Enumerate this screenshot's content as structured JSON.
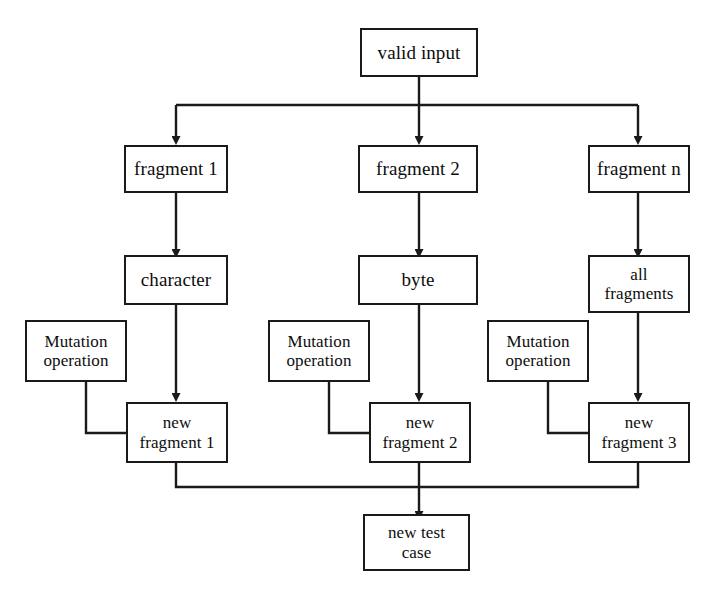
{
  "diagram": {
    "style": {
      "background": "#ffffff",
      "stroke": "#1a1a1a",
      "text": "#0d0d0d"
    },
    "nodes": {
      "valid_input": {
        "label": "valid input"
      },
      "fragment_1": {
        "label": "fragment 1"
      },
      "fragment_2": {
        "label": "fragment 2"
      },
      "fragment_n": {
        "label": "fragment n"
      },
      "character": {
        "label": "character"
      },
      "byte": {
        "label": "byte"
      },
      "all_fragments": {
        "label_line1": "all",
        "label_line2": "fragments"
      },
      "mutation_operation_1": {
        "label_line1": "Mutation",
        "label_line2": "operation"
      },
      "mutation_operation_2": {
        "label_line1": "Mutation",
        "label_line2": "operation"
      },
      "mutation_operation_3": {
        "label_line1": "Mutation",
        "label_line2": "operation"
      },
      "new_fragment_1": {
        "label_line1": "new",
        "label_line2": "fragment 1"
      },
      "new_fragment_2": {
        "label_line1": "new",
        "label_line2": "fragment 2"
      },
      "new_fragment_3": {
        "label_line1": "new",
        "label_line2": "fragment 3"
      },
      "new_test_case": {
        "label_line1": "new test",
        "label_line2": "case"
      }
    },
    "edges": [
      {
        "from": "valid_input",
        "to": "fragment_1",
        "arrow": true
      },
      {
        "from": "valid_input",
        "to": "fragment_2",
        "arrow": true
      },
      {
        "from": "valid_input",
        "to": "fragment_n",
        "arrow": true
      },
      {
        "from": "fragment_1",
        "to": "character",
        "arrow": true
      },
      {
        "from": "fragment_2",
        "to": "byte",
        "arrow": true
      },
      {
        "from": "fragment_n",
        "to": "all_fragments",
        "arrow": true
      },
      {
        "from": "character",
        "to": "new_fragment_1",
        "arrow": true
      },
      {
        "from": "byte",
        "to": "new_fragment_2",
        "arrow": true
      },
      {
        "from": "all_fragments",
        "to": "new_fragment_3",
        "arrow": true
      },
      {
        "from": "mutation_operation_1",
        "to": "new_fragment_1",
        "arrow": false
      },
      {
        "from": "mutation_operation_2",
        "to": "new_fragment_2",
        "arrow": false
      },
      {
        "from": "mutation_operation_3",
        "to": "new_fragment_3",
        "arrow": false
      },
      {
        "from": "new_fragment_1",
        "to": "new_test_case",
        "arrow": true
      },
      {
        "from": "new_fragment_2",
        "to": "new_test_case",
        "arrow": true
      },
      {
        "from": "new_fragment_3",
        "to": "new_test_case",
        "arrow": true
      }
    ]
  }
}
